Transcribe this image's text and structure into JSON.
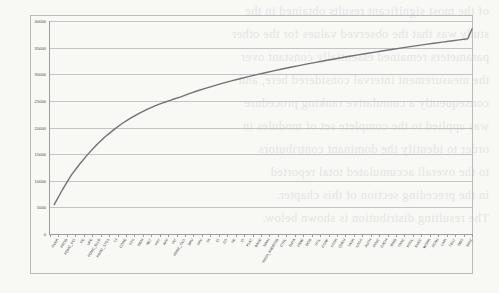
{
  "page": {
    "background_color": "#f8f8f5",
    "bleed_through_lines": [
      "of the most significant results obtained in the",
      "study was that the observed values for the other",
      "parameters remained essentially constant over",
      "the measurement interval considered here, and",
      "consequently a cumulative ranking procedure",
      "was applied to the complete set of modules in",
      "order to identify the dominant contributors",
      "to the overall accumulated total reported",
      "in the preceding section of this chapter.",
      "The resulting distribution is shown below."
    ]
  },
  "chart_frame": {
    "border_color": "#b9bbbd",
    "axis_color": "#9a9da1",
    "gridline_color": "#c2c5c8",
    "series_color": "#6f7277"
  },
  "chart_data": {
    "type": "line",
    "title": "",
    "subtitle": "",
    "xlabel": "",
    "ylabel": "",
    "ylim": [
      0,
      40000
    ],
    "ytick_values": [
      0,
      5000,
      10000,
      15000,
      20000,
      25000,
      30000,
      35000,
      40000
    ],
    "ytick_labels": [
      "0",
      "5000",
      "10000",
      "15000",
      "20000",
      "25000",
      "30000",
      "35000",
      "40000"
    ],
    "grid": true,
    "legend": false,
    "legend_position": "none",
    "categories": [
      "OVER",
      "PROD",
      "PDMC_PCI",
      "PE",
      "UPE",
      "PDMC_ELLB",
      "PDMC_STG1",
      "TJ",
      "CORE",
      "SYS",
      "MEM",
      "NET",
      "PRT",
      "APP",
      "INT",
      "PDMC_OLO",
      "DRV",
      "SRV",
      "TR",
      "CI",
      "CO",
      "SE",
      "IO",
      "PLAT",
      "BASE",
      "MAIN",
      "HASH_ANDROID",
      "CTRL",
      "DATA",
      "VIEW",
      "MOD",
      "UTIL",
      "CONF",
      "STOR",
      "QUEU",
      "TASK",
      "LOGS",
      "AUTH",
      "SYNC",
      "CACH",
      "BIND",
      "TRAC",
      "POOL",
      "EXEC",
      "WORK",
      "SCAN",
      "LINK",
      "TEST",
      "DBG",
      "MISC"
    ],
    "values": [
      5500,
      8400,
      11000,
      13100,
      15000,
      16700,
      18200,
      19500,
      20700,
      21700,
      22600,
      23400,
      24100,
      24700,
      25250,
      25750,
      26350,
      26900,
      27400,
      27870,
      28320,
      28750,
      29160,
      29550,
      29930,
      30290,
      30640,
      30980,
      31310,
      31630,
      31940,
      32240,
      32530,
      32820,
      33100,
      33370,
      33640,
      33900,
      34160,
      34410,
      34660,
      34900,
      35140,
      35370,
      35600,
      35820,
      36040,
      36250,
      36460,
      36670
    ],
    "curve_start_value": 5500,
    "curve_end_value": 38500,
    "x_tick_count": 50
  }
}
